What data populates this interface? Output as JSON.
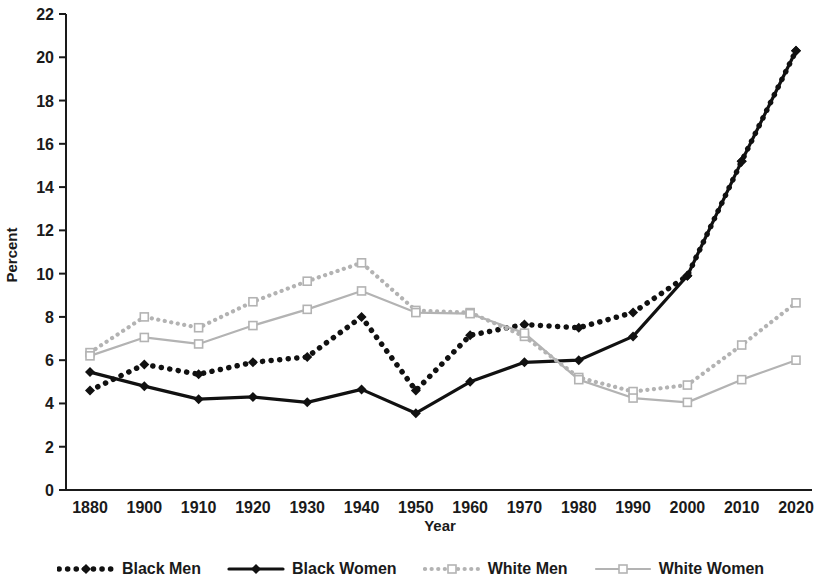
{
  "chart_data": {
    "type": "line",
    "title": "",
    "xlabel": "Year",
    "ylabel": "Percent",
    "categories": [
      "1880",
      "1900",
      "1910",
      "1920",
      "1930",
      "1940",
      "1950",
      "1960",
      "1970",
      "1980",
      "1990",
      "2000",
      "2010",
      "2020"
    ],
    "ylim": [
      0,
      22
    ],
    "ytick_step": 2,
    "yticks": [
      "0",
      "2",
      "4",
      "6",
      "8",
      "10",
      "12",
      "14",
      "16",
      "18",
      "20",
      "22"
    ],
    "grid": false,
    "legend_position": "bottom",
    "series": [
      {
        "name": "Black Men",
        "color": "#111111",
        "line_style": "dotted",
        "marker": "filled-diamond",
        "values": [
          4.6,
          5.8,
          5.35,
          5.9,
          6.15,
          8.0,
          4.6,
          7.15,
          7.65,
          7.5,
          8.2,
          9.9,
          15.2,
          20.3
        ]
      },
      {
        "name": "Black Women",
        "color": "#111111",
        "line_style": "solid",
        "marker": "filled-diamond",
        "values": [
          5.45,
          4.8,
          4.2,
          4.3,
          4.05,
          4.65,
          3.55,
          5.0,
          5.9,
          6.0,
          7.1,
          9.9,
          15.2,
          20.3
        ]
      },
      {
        "name": "White Men",
        "color": "#b3b3b3",
        "line_style": "dotted",
        "marker": "open-square",
        "values": [
          6.35,
          8.0,
          7.5,
          8.7,
          9.65,
          10.5,
          8.3,
          8.2,
          7.1,
          5.2,
          4.55,
          4.85,
          6.7,
          8.65
        ]
      },
      {
        "name": "White Women",
        "color": "#b3b3b3",
        "line_style": "solid",
        "marker": "open-square",
        "values": [
          6.2,
          7.05,
          6.75,
          7.6,
          8.35,
          9.2,
          8.2,
          8.15,
          7.25,
          5.1,
          4.25,
          4.05,
          5.1,
          6.0
        ]
      }
    ]
  },
  "legend": {
    "items": [
      {
        "label": "Black Men"
      },
      {
        "label": "Black Women"
      },
      {
        "label": "White Men"
      },
      {
        "label": "White Women"
      }
    ]
  }
}
